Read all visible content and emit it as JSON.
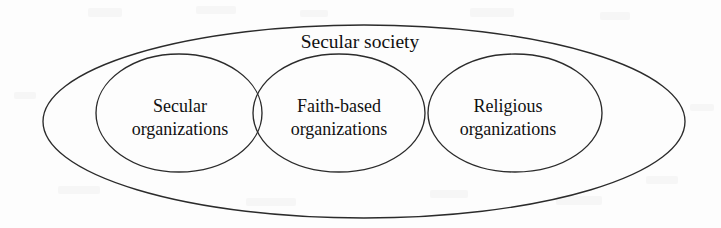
{
  "figure": {
    "type": "venn-diagram",
    "background_color": "#fdfdfd",
    "stroke_color": "#2b2b2b",
    "text_color": "#111111",
    "universe": {
      "label": "Secular society",
      "shape": "ellipse"
    },
    "sets": [
      {
        "id": "secular-organizations",
        "label_line1": "Secular",
        "label_line2": "organizations",
        "shape": "ellipse"
      },
      {
        "id": "faith-based-organizations",
        "label_line1": "Faith-based",
        "label_line2": "organizations",
        "shape": "ellipse"
      },
      {
        "id": "religious-organizations",
        "label_line1": "Religious",
        "label_line2": "organizations",
        "shape": "ellipse"
      }
    ],
    "overlaps": [
      {
        "id": "secular-faith-overlap",
        "between": "Secular organizations and Faith-based organizations"
      },
      {
        "id": "faith-religious-overlap",
        "between": "Faith-based organizations and Religious organizations"
      }
    ]
  }
}
